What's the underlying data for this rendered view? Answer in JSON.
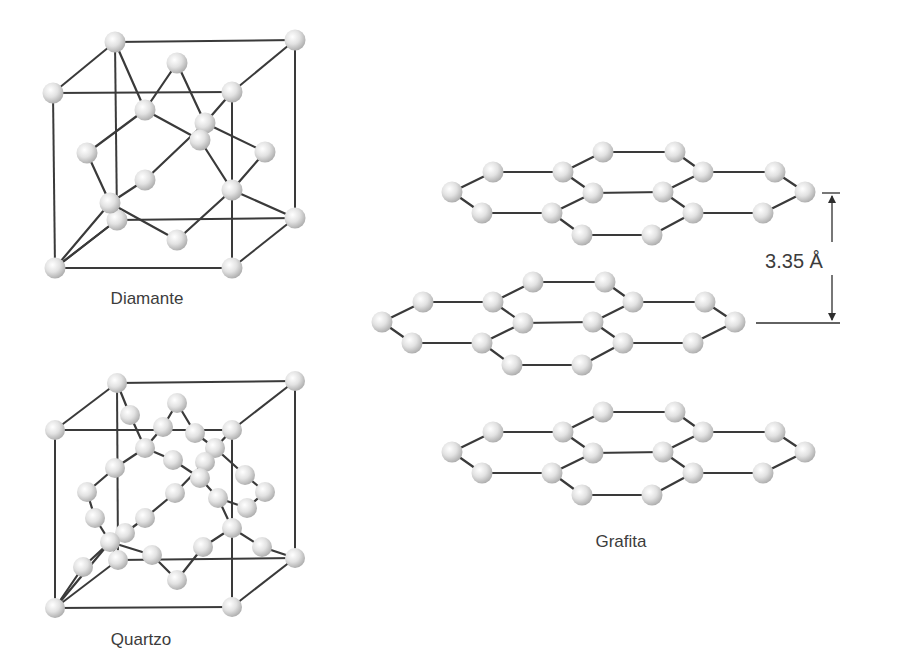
{
  "figure": {
    "diamond_label": "Diamante",
    "quartz_label": "Quartzo",
    "graphite_label": "Grafita",
    "layer_spacing_label": "3.35 Å"
  },
  "colors": {
    "atom_highlight": "#ffffff",
    "atom_mid": "#e2e2e2",
    "atom_shadow": "#a9a9a9",
    "bond": "#3a3a3a",
    "text": "#3c3c3c"
  }
}
